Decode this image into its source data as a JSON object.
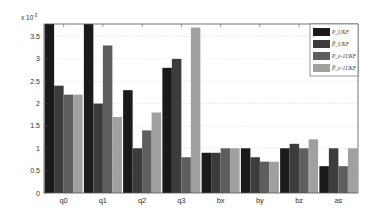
{
  "chart_data": {
    "type": "bar",
    "title": "",
    "xlabel": "",
    "ylabel": "",
    "y_multiplier": "x 10^-3",
    "ylim": [
      0,
      3.78
    ],
    "yticks": [
      0,
      0.5,
      1,
      1.5,
      2,
      2.5,
      3,
      3.5
    ],
    "ytick_labels": [
      "0",
      "0.5",
      "1",
      "1.5",
      "2",
      "2.5",
      "3",
      "3.5"
    ],
    "grid": true,
    "legend_position": "upper right",
    "categories": [
      "q0",
      "q1",
      "q2",
      "q3",
      "bx",
      "by",
      "bz",
      "as"
    ],
    "series": [
      {
        "name": "P_UKF",
        "color": "#1a1a1a",
        "values": [
          3.8,
          3.8,
          2.3,
          2.8,
          0.9,
          1.0,
          1.0,
          0.6
        ]
      },
      {
        "name": "P̂_UKF",
        "color": "#3c3c3c",
        "values": [
          2.4,
          2.0,
          1.0,
          3.0,
          0.9,
          0.8,
          1.1,
          1.0
        ]
      },
      {
        "name": "P_e-1UKF",
        "color": "#5e5e5e",
        "values": [
          2.2,
          3.3,
          1.4,
          0.8,
          1.0,
          0.7,
          1.0,
          0.6
        ]
      },
      {
        "name": "P̂_e-1UKF",
        "color": "#a0a0a0",
        "values": [
          2.2,
          1.7,
          1.8,
          3.7,
          1.0,
          0.7,
          1.2,
          1.0
        ]
      }
    ]
  }
}
